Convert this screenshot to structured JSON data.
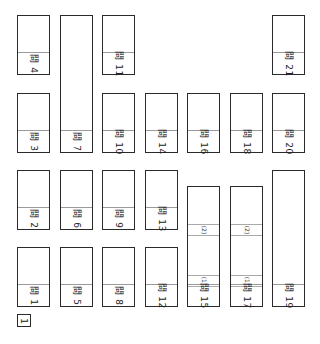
{
  "sheet": {
    "section_number": "1",
    "question_prefix": "問",
    "boxes": [
      {
        "id": 1,
        "label": "問 1"
      },
      {
        "id": 2,
        "label": "問 2"
      },
      {
        "id": 3,
        "label": "問 3"
      },
      {
        "id": 4,
        "label": "問 4"
      },
      {
        "id": 5,
        "label": "問 5"
      },
      {
        "id": 6,
        "label": "問 6"
      },
      {
        "id": 7,
        "label": "問 7"
      },
      {
        "id": 8,
        "label": "問 8"
      },
      {
        "id": 9,
        "label": "問 9"
      },
      {
        "id": 10,
        "label": "問 10"
      },
      {
        "id": 11,
        "label": "問 11"
      },
      {
        "id": 12,
        "label": "問 12"
      },
      {
        "id": 13,
        "label": "問 13"
      },
      {
        "id": 14,
        "label": "問 14"
      },
      {
        "id": 15,
        "label": "問 15",
        "parts": [
          "(1)",
          "(2)"
        ]
      },
      {
        "id": 16,
        "label": "問 16"
      },
      {
        "id": 17,
        "label": "問 17",
        "parts": [
          "(1)",
          "(2)"
        ]
      },
      {
        "id": 18,
        "label": "問 18"
      },
      {
        "id": 19,
        "label": "問 19"
      },
      {
        "id": 20,
        "label": "問 20"
      },
      {
        "id": 21,
        "label": "問 21"
      }
    ]
  }
}
